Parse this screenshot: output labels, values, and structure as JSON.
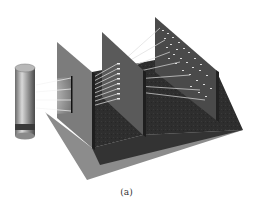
{
  "figure": {
    "caption": "(a)",
    "components": [
      {
        "name": "light-source",
        "label": ""
      },
      {
        "name": "single-slit-barrier",
        "label": ""
      },
      {
        "name": "multi-slit-barrier",
        "label": ""
      },
      {
        "name": "detection-screen",
        "label": ""
      }
    ],
    "colors": {
      "floor_light": "#8a8a8a",
      "floor_dark": "#2e2e2e",
      "barrier1": "#7a7a7a",
      "barrier2": "#5c5c5c",
      "screen": "#4a4a4a",
      "rays": "#e8e8e8"
    }
  }
}
